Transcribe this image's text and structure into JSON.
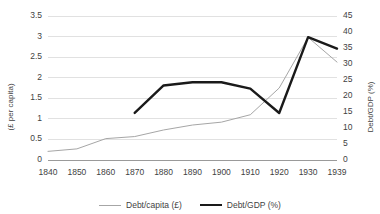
{
  "chart_data": {
    "type": "line",
    "title": "",
    "xlabel": "",
    "grid": "horizontal",
    "legend_position": "bottom",
    "categories": [
      "1840",
      "1850",
      "1860",
      "1870",
      "1880",
      "1890",
      "1900",
      "1910",
      "1920",
      "1930",
      "1939"
    ],
    "axes": {
      "left": {
        "label": "(£ per capita)",
        "ticks": [
          "0",
          "0.5",
          "1",
          "1.5",
          "2",
          "2.5",
          "3",
          "3.5"
        ],
        "tick_values": [
          0,
          0.5,
          1,
          1.5,
          2,
          2.5,
          3,
          3.5
        ],
        "ylim": [
          0,
          3.5
        ]
      },
      "right": {
        "label": "Debt/GDP (%)",
        "ticks": [
          "0",
          "5",
          "10",
          "15",
          "20",
          "25",
          "30",
          "35",
          "40",
          "45"
        ],
        "tick_values": [
          0,
          5,
          10,
          15,
          20,
          25,
          30,
          35,
          40,
          45
        ],
        "ylim": [
          0,
          45
        ]
      }
    },
    "series": [
      {
        "name": "Debt/capita (£)",
        "axis": "left",
        "color": "#a6a6a6",
        "width": 1,
        "x": [
          "1840",
          "1850",
          "1860",
          "1870",
          "1880",
          "1890",
          "1900",
          "1910",
          "1920",
          "1930",
          "1939"
        ],
        "values": [
          0.21,
          0.27,
          0.52,
          0.57,
          0.73,
          0.85,
          0.92,
          1.1,
          1.75,
          2.98,
          2.38
        ]
      },
      {
        "name": "Debt/GDP (%)",
        "axis": "right",
        "color": "#1a1a1a",
        "width": 2.4,
        "x": [
          "1870",
          "1880",
          "1890",
          "1900",
          "1910",
          "1920",
          "1930",
          "1939"
        ],
        "values": [
          14.7,
          23.3,
          24.3,
          24.3,
          22.3,
          14.7,
          38.4,
          34.8
        ]
      }
    ]
  },
  "legend": {
    "items": [
      {
        "label": "Debt/capita (£)",
        "style": "thin"
      },
      {
        "label": "Debt/GDP (%)",
        "style": "thick"
      }
    ]
  }
}
